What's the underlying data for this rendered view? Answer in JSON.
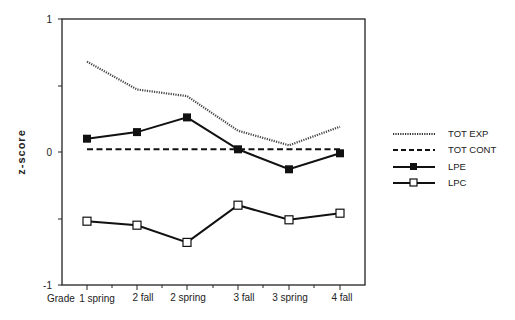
{
  "chart_data": {
    "type": "line",
    "title": "",
    "xlabel": "",
    "ylabel": "z-score",
    "ylim": [
      -1,
      1
    ],
    "yticks": [
      -1,
      0,
      1
    ],
    "x_prefix": "Grade",
    "categories": [
      "1 spring",
      "2 fall",
      "2 spring",
      "3 fall",
      "3 spring",
      "4 fall"
    ],
    "grid": false,
    "legend_position": "right",
    "series": [
      {
        "name": "TOT EXP",
        "style": "dotted",
        "marker": "none",
        "values": [
          0.68,
          0.47,
          0.42,
          0.16,
          0.05,
          0.19
        ]
      },
      {
        "name": "TOT CONT",
        "style": "dashed",
        "marker": "none",
        "values": [
          0.02,
          0.02,
          0.02,
          0.02,
          0.02,
          0.02
        ]
      },
      {
        "name": "LPE",
        "style": "solid",
        "marker": "filled-square",
        "values": [
          0.1,
          0.15,
          0.26,
          0.02,
          -0.13,
          -0.01
        ]
      },
      {
        "name": "LPC",
        "style": "solid",
        "marker": "open-square",
        "values": [
          -0.52,
          -0.55,
          -0.68,
          -0.4,
          -0.51,
          -0.46
        ]
      }
    ]
  },
  "labels": {
    "ytick_top": "1",
    "ytick_mid": "0",
    "ytick_bottom": "-1",
    "ylabel": "z-score",
    "x_prefix": "Grade",
    "x0": "1 spring",
    "x1": "2 fall",
    "x2": "2 spring",
    "x3": "3 fall",
    "x4": "3 spring",
    "x5": "4 fall",
    "legend0": "TOT EXP",
    "legend1": "TOT CONT",
    "legend2": "LPE",
    "legend3": "LPC"
  }
}
